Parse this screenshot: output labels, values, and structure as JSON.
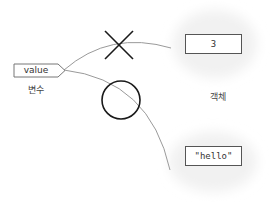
{
  "variable": {
    "name": "value",
    "caption": "변수"
  },
  "objects": {
    "caption": "객체",
    "items": [
      {
        "value": "3",
        "status": "no-longer-referenced"
      },
      {
        "value": "\"hello\"",
        "status": "referenced"
      }
    ]
  },
  "markers": {
    "old_reference": "cross-icon",
    "new_reference": "circle-icon"
  },
  "colors": {
    "line": "#999999",
    "marker": "#1a1a1a",
    "box_border": "#555555",
    "cloud": "#f2f2f2"
  }
}
